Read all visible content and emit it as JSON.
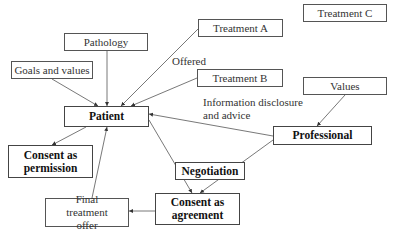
{
  "diagram": {
    "nodes": {
      "goals": "Goals and values",
      "pathology": "Pathology",
      "treatment_a": "Treatment A",
      "treatment_b": "Treatment B",
      "treatment_c": "Treatment C",
      "values": "Values",
      "patient": "Patient",
      "professional": "Professional",
      "negotiation": "Negotiation",
      "consent_permission": "Consent as permission",
      "consent_agreement": "Consent as agreement",
      "final_offer": "Final treatment offer"
    },
    "labels": {
      "offered": "Offered",
      "info_line1": "Information disclosure",
      "info_line2": "and advice"
    },
    "edges": [
      {
        "from": "Goals and values",
        "to": "Patient"
      },
      {
        "from": "Pathology",
        "to": "Patient"
      },
      {
        "from": "Treatment A",
        "to": "Patient",
        "label": "Offered"
      },
      {
        "from": "Treatment B",
        "to": "Patient"
      },
      {
        "from": "Professional",
        "to": "Patient",
        "label": "Information disclosure and advice"
      },
      {
        "from": "Values",
        "to": "Professional"
      },
      {
        "from": "Patient",
        "to": "Consent as permission"
      },
      {
        "from": "Patient",
        "to": "Consent as agreement"
      },
      {
        "from": "Professional",
        "to": "Consent as agreement"
      },
      {
        "from": "Consent as agreement",
        "to": "Final treatment offer"
      },
      {
        "from": "Final treatment offer",
        "to": "Patient"
      }
    ]
  }
}
